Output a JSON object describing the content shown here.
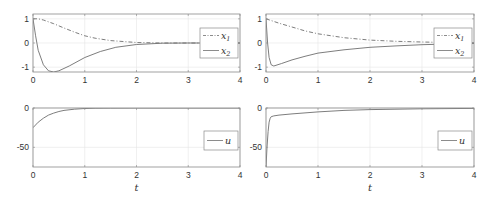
{
  "chart_data": [
    {
      "type": "line",
      "panel": "top-left",
      "title": "",
      "xlabel": "",
      "ylabel": "",
      "xlim": [
        0,
        4
      ],
      "ylim": [
        -1.2,
        1.2
      ],
      "xticks": [
        0,
        1,
        2,
        3,
        4
      ],
      "yticks": [
        -1,
        0,
        1
      ],
      "grid": true,
      "legend_position": "east",
      "series": [
        {
          "name": "x_1",
          "style": "dash-dot",
          "x": [
            0,
            0.1,
            0.2,
            0.4,
            0.6,
            0.8,
            1.0,
            1.2,
            1.5,
            2.0,
            2.5,
            3.0,
            4.0
          ],
          "values": [
            1.0,
            1.0,
            0.95,
            0.8,
            0.62,
            0.45,
            0.3,
            0.2,
            0.1,
            0.02,
            0.0,
            0.0,
            0.0
          ]
        },
        {
          "name": "x_2",
          "style": "solid",
          "x": [
            0,
            0.05,
            0.1,
            0.2,
            0.3,
            0.4,
            0.5,
            0.7,
            1.0,
            1.3,
            1.6,
            2.0,
            2.5,
            3.0,
            4.0
          ],
          "values": [
            1.0,
            0.3,
            -0.3,
            -0.9,
            -1.15,
            -1.2,
            -1.15,
            -0.95,
            -0.6,
            -0.35,
            -0.18,
            -0.06,
            -0.01,
            0.0,
            0.0
          ]
        }
      ]
    },
    {
      "type": "line",
      "panel": "top-right",
      "title": "",
      "xlabel": "",
      "ylabel": "",
      "xlim": [
        0,
        4
      ],
      "ylim": [
        -1.2,
        1.2
      ],
      "xticks": [
        0,
        1,
        2,
        3,
        4
      ],
      "yticks": [
        -1,
        0,
        1
      ],
      "grid": true,
      "legend_position": "east",
      "series": [
        {
          "name": "x_1",
          "style": "dash-dot",
          "x": [
            0,
            0.25,
            0.5,
            0.75,
            1.0,
            1.5,
            2.0,
            2.5,
            3.0,
            3.5,
            4.0
          ],
          "values": [
            1.0,
            0.82,
            0.66,
            0.5,
            0.38,
            0.22,
            0.12,
            0.07,
            0.04,
            0.02,
            0.01
          ]
        },
        {
          "name": "x_2",
          "style": "solid",
          "x": [
            0,
            0.03,
            0.06,
            0.1,
            0.15,
            0.3,
            0.5,
            0.75,
            1.0,
            1.5,
            2.0,
            2.5,
            3.0,
            3.5,
            4.0
          ],
          "values": [
            1.0,
            0.0,
            -0.6,
            -0.9,
            -0.95,
            -0.85,
            -0.7,
            -0.55,
            -0.42,
            -0.28,
            -0.18,
            -0.12,
            -0.07,
            -0.04,
            -0.02
          ]
        }
      ]
    },
    {
      "type": "line",
      "panel": "bottom-left",
      "title": "",
      "xlabel": "t",
      "ylabel": "",
      "xlim": [
        0,
        4
      ],
      "ylim": [
        -75,
        0
      ],
      "xticks": [
        0,
        1,
        2,
        3,
        4
      ],
      "yticks": [
        -50,
        0
      ],
      "grid": true,
      "legend_position": "east",
      "series": [
        {
          "name": "u",
          "style": "solid",
          "x": [
            0,
            0.1,
            0.2,
            0.3,
            0.4,
            0.5,
            0.6,
            0.8,
            1.0,
            1.2,
            1.5,
            2.0,
            4.0
          ],
          "values": [
            -25,
            -18,
            -13,
            -9,
            -6.5,
            -4.5,
            -3,
            -1.5,
            -0.6,
            -0.3,
            -0.1,
            0,
            0
          ]
        }
      ]
    },
    {
      "type": "line",
      "panel": "bottom-right",
      "title": "",
      "xlabel": "t",
      "ylabel": "",
      "xlim": [
        0,
        4
      ],
      "ylim": [
        -75,
        0
      ],
      "xticks": [
        0,
        1,
        2,
        3,
        4
      ],
      "yticks": [
        -50,
        0
      ],
      "grid": true,
      "legend_position": "east",
      "series": [
        {
          "name": "u",
          "style": "solid",
          "x": [
            0,
            0.02,
            0.04,
            0.06,
            0.08,
            0.1,
            0.15,
            0.25,
            0.5,
            1.0,
            1.5,
            2.0,
            3.0,
            4.0
          ],
          "values": [
            -75,
            -50,
            -30,
            -18,
            -13,
            -11,
            -10,
            -9,
            -7.5,
            -5,
            -3,
            -2,
            -1,
            -0.5
          ]
        }
      ]
    }
  ],
  "panels": {
    "top_left": {
      "legend": [
        "x",
        "x"
      ],
      "legend_subs": [
        "1",
        "2"
      ],
      "yticks": [
        "1",
        "0",
        "-1"
      ],
      "xticks": [
        "0",
        "1",
        "2",
        "3",
        "4"
      ]
    },
    "top_right": {
      "legend": [
        "x",
        "x"
      ],
      "legend_subs": [
        "1",
        "2"
      ],
      "yticks": [
        "1",
        "0",
        "-1"
      ],
      "xticks": [
        "0",
        "1",
        "2",
        "3",
        "4"
      ]
    },
    "bottom_left": {
      "legend": [
        "u"
      ],
      "yticks": [
        "0",
        "-50"
      ],
      "xticks": [
        "0",
        "1",
        "2",
        "3",
        "4"
      ],
      "xlabel": "t"
    },
    "bottom_right": {
      "legend": [
        "u"
      ],
      "yticks": [
        "0",
        "-50"
      ],
      "xticks": [
        "0",
        "1",
        "2",
        "3",
        "4"
      ],
      "xlabel": "t"
    }
  },
  "colors": {
    "axis": "#8a8a8a",
    "grid": "#e6e6e6",
    "line": "#6e6e6e",
    "text": "#333333"
  }
}
